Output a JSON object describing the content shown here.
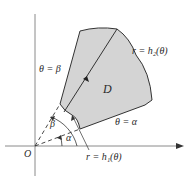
{
  "figure": {
    "labels": {
      "theta_beta": "θ = β",
      "theta_alpha": "θ = α",
      "outer_curve": "r = h₂(θ)",
      "inner_curve": "r = h₁(θ)",
      "region": "D",
      "origin": "O",
      "angle_beta": "β",
      "angle_alpha": "α"
    },
    "colors": {
      "region_fill": "#d4d4d4",
      "stroke": "#333333",
      "axis": "#8a8a8a",
      "background": "#ffffff"
    }
  }
}
